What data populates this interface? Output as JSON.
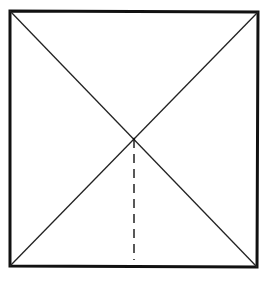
{
  "diagram": {
    "type": "geometric-figure",
    "colors": {
      "stroke": "#111111",
      "background": "#ffffff"
    },
    "square": {
      "top_left": [
        10,
        11
      ],
      "top_right": [
        258,
        12
      ],
      "bottom_right": [
        257,
        267
      ],
      "bottom_left": [
        10,
        266
      ]
    },
    "diagonals": [
      {
        "from": [
          10,
          11
        ],
        "to": [
          257,
          267
        ]
      },
      {
        "from": [
          258,
          12
        ],
        "to": [
          10,
          266
        ]
      }
    ],
    "intersection": [
      134,
      139
    ],
    "dashed_segment": {
      "from": [
        134,
        139
      ],
      "to": [
        134,
        260
      ]
    }
  }
}
